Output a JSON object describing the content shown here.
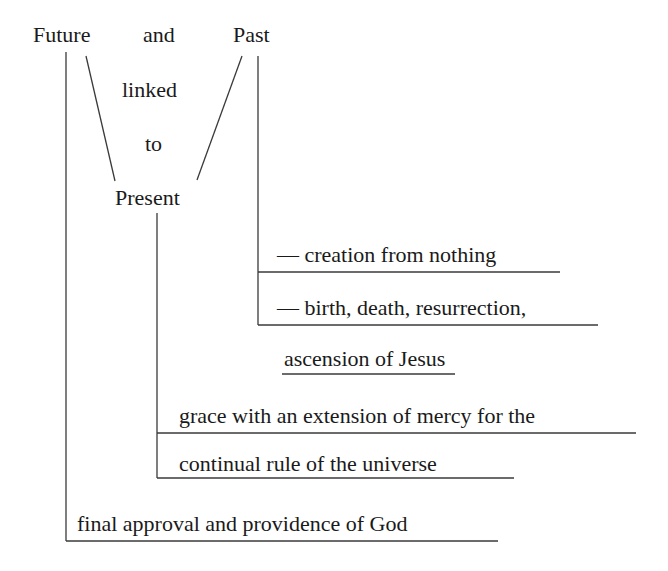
{
  "diagram": {
    "top_words": {
      "future": "Future",
      "and": "and",
      "past": "Past",
      "linked": "linked",
      "to": "to",
      "present": "Present"
    },
    "past_branch": {
      "item1": "— creation from nothing",
      "item2": "— birth, death, resurrection,",
      "item2_cont": "ascension of Jesus"
    },
    "present_branch": {
      "item1": "grace with an extension of mercy for the",
      "item2": "continual rule of the universe"
    },
    "future_branch": {
      "item1": "final approval and providence of God"
    },
    "line_color": "#3a3a3a"
  }
}
